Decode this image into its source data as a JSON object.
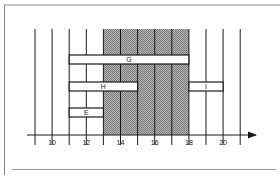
{
  "chart_data": {
    "type": "gantt",
    "title": "",
    "xlabel": "",
    "x_ticks": [
      9,
      10,
      11,
      12,
      13,
      14,
      15,
      16,
      17,
      18,
      19,
      20,
      21
    ],
    "x_tick_labels": [
      {
        "value": 10,
        "label": "10"
      },
      {
        "value": 12,
        "label": "12"
      },
      {
        "value": 14,
        "label": "14"
      },
      {
        "value": 16,
        "label": "16"
      },
      {
        "value": 18,
        "label": "18"
      },
      {
        "value": 20,
        "label": "20"
      }
    ],
    "xlim": [
      8.5,
      21.8
    ],
    "shaded_region": {
      "start": 13,
      "end": 18,
      "fill": "#9a9a9a"
    },
    "intervals": [
      {
        "label": "G",
        "start": 11,
        "end": 18,
        "row": 3
      },
      {
        "label": "H",
        "start": 11,
        "end": 15,
        "row": 2
      },
      {
        "label": "I",
        "start": 18,
        "end": 20,
        "row": 2
      },
      {
        "label": "E",
        "start": 11,
        "end": 13,
        "row": 1
      }
    ],
    "grid": true
  },
  "colors": {
    "line": "#1a1a1a",
    "shade": "#9a9a9a",
    "frame": "#8a8a8a",
    "background": "#ffffff"
  }
}
